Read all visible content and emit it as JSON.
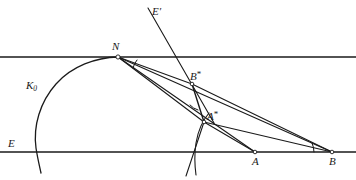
{
  "figure": {
    "background_color": "#ffffff",
    "stroke_color": "#1a1a1a",
    "width": 356,
    "height": 180,
    "labels": [
      {
        "id": "E-prime",
        "text": "E",
        "accent": "prime",
        "x": 152,
        "y": 6
      },
      {
        "id": "N",
        "text": "N",
        "accent": "none",
        "x": 112,
        "y": 41
      },
      {
        "id": "B-star",
        "text": "B",
        "accent": "star",
        "x": 190,
        "y": 70
      },
      {
        "id": "K0",
        "text": "K",
        "accent": "sub0",
        "x": 26,
        "y": 80
      },
      {
        "id": "A-star",
        "text": "A",
        "accent": "star",
        "x": 207,
        "y": 110
      },
      {
        "id": "E",
        "text": "E",
        "accent": "none",
        "x": 8,
        "y": 138
      },
      {
        "id": "A",
        "text": "A",
        "accent": "none",
        "x": 252,
        "y": 156
      },
      {
        "id": "B",
        "text": "B",
        "accent": "none",
        "x": 329,
        "y": 156
      }
    ],
    "points": [
      {
        "id": "point-N",
        "label": "N",
        "x": 118,
        "y": 57
      },
      {
        "id": "point-B-star",
        "label": "B*",
        "x": 192,
        "y": 84
      },
      {
        "id": "point-A-star",
        "label": "A*",
        "x": 204,
        "y": 122
      },
      {
        "id": "point-A",
        "label": "A",
        "x": 255,
        "y": 152
      },
      {
        "id": "point-B",
        "label": "B",
        "x": 332,
        "y": 152
      }
    ],
    "lines": [
      {
        "id": "line-E-prime-upper",
        "from": [
          0,
          57
        ],
        "to": [
          356,
          57
        ]
      },
      {
        "id": "line-E-baseline",
        "from": [
          0,
          152
        ],
        "to": [
          356,
          152
        ]
      },
      {
        "id": "ray-E-prime",
        "from": [
          148,
          8
        ],
        "to": [
          214,
          123
        ]
      },
      {
        "id": "chord-N-to-B-star",
        "from": [
          118,
          57
        ],
        "to": [
          192,
          84
        ]
      },
      {
        "id": "chord-N-to-A-star",
        "from": [
          118,
          57
        ],
        "to": [
          204,
          122
        ]
      },
      {
        "id": "chord-N-to-A",
        "from": [
          118,
          57
        ],
        "to": [
          255,
          152
        ]
      },
      {
        "id": "chord-N-to-B",
        "from": [
          118,
          57
        ],
        "to": [
          332,
          152
        ]
      },
      {
        "id": "seg-B-star-to-A-star",
        "from": [
          192,
          84
        ],
        "to": [
          204,
          122
        ]
      },
      {
        "id": "seg-B-star-to-B",
        "from": [
          192,
          84
        ],
        "to": [
          332,
          152
        ]
      },
      {
        "id": "seg-A-star-to-A",
        "from": [
          204,
          122
        ],
        "to": [
          255,
          152
        ]
      },
      {
        "id": "seg-A-star-to-B",
        "from": [
          204,
          122
        ],
        "to": [
          332,
          152
        ]
      },
      {
        "id": "seg-A-star-down",
        "from": [
          204,
          122
        ],
        "to": [
          186,
          176
        ]
      }
    ],
    "arcs": [
      {
        "id": "arc-K0",
        "description": "large circle tangent to upper line at N"
      },
      {
        "id": "arc-through-A-star",
        "description": "small circle arc passing through A* crossing baseline"
      },
      {
        "id": "angle-mark-N",
        "description": "angle mark at N between chords"
      },
      {
        "id": "angle-mark-A-star",
        "description": "angle mark at A* between B*A* and incoming ray"
      },
      {
        "id": "angle-mark-B",
        "description": "angle mark at B between baseline and B*B"
      }
    ]
  }
}
